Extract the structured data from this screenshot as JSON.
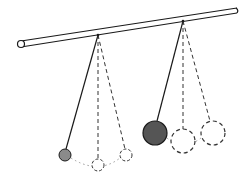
{
  "diagram": {
    "title": "Two pendulums of different mass hanging from a horizontal rod",
    "colors": {
      "line": "#1a1a1a",
      "dashed": "#333333",
      "small_bob_fill": "#8a8a8a",
      "large_bob_fill": "#555555",
      "background": "#ffffff"
    },
    "rod": {
      "x1": 21,
      "y1": 44,
      "x2": 237,
      "y2": 11,
      "thickness": 6
    },
    "pendulums": [
      {
        "name": "small",
        "pivot": [
          98,
          35
        ],
        "bob": {
          "cx": 65,
          "cy": 155,
          "r": 6
        },
        "ghost_positions": [
          {
            "cx": 98,
            "cy": 165,
            "r": 6
          },
          {
            "cx": 126,
            "cy": 155,
            "r": 6
          }
        ]
      },
      {
        "name": "large",
        "pivot": [
          183,
          21
        ],
        "bob": {
          "cx": 155,
          "cy": 133,
          "r": 12
        },
        "ghost_positions": [
          {
            "cx": 183,
            "cy": 141,
            "r": 12
          },
          {
            "cx": 213,
            "cy": 133,
            "r": 12
          }
        ]
      }
    ]
  }
}
